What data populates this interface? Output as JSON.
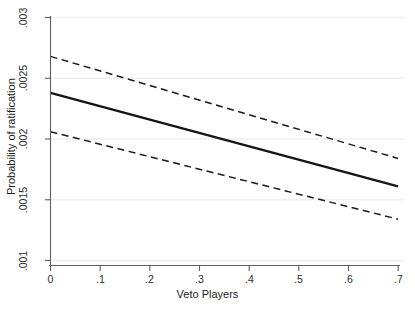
{
  "chart_data": {
    "type": "line",
    "title": "",
    "xlabel": "Veto Players",
    "ylabel": "Probability of ratification",
    "xlim": [
      0,
      0.7
    ],
    "ylim": [
      0.001,
      0.003
    ],
    "xticks": [
      "0",
      ".1",
      ".2",
      ".3",
      ".4",
      ".5",
      ".6",
      ".7"
    ],
    "xtick_values": [
      0,
      0.1,
      0.2,
      0.3,
      0.4,
      0.5,
      0.6,
      0.7
    ],
    "yticks": [
      ".001",
      ".0015",
      ".002",
      ".0025",
      ".003"
    ],
    "ytick_values": [
      0.001,
      0.0015,
      0.002,
      0.0025,
      0.003
    ],
    "grid": "horizontal",
    "legend": "none",
    "series": [
      {
        "name": "Predicted probability",
        "style": "solid",
        "color": "#1a1a1a",
        "x": [
          0,
          0.7
        ],
        "values": [
          0.00238,
          0.00161
        ]
      },
      {
        "name": "Upper 95% confidence bound",
        "style": "dashed",
        "color": "#1a1a1a",
        "x": [
          0,
          0.7
        ],
        "values": [
          0.00268,
          0.00184
        ]
      },
      {
        "name": "Lower 95% confidence bound",
        "style": "dashed",
        "color": "#1a1a1a",
        "x": [
          0,
          0.7
        ],
        "values": [
          0.00206,
          0.00134
        ]
      }
    ]
  },
  "axes": {
    "x_title": "Veto Players",
    "y_title": "Probability of ratification",
    "x_tick_labels": [
      "0",
      ".1",
      ".2",
      ".3",
      ".4",
      ".5",
      ".6",
      ".7"
    ],
    "y_tick_labels": [
      ".001",
      ".0015",
      ".002",
      ".0025",
      ".003"
    ]
  },
  "colors": {
    "line": "#1a1a1a",
    "axis": "#5a5a5a",
    "grid": "#eeeeee",
    "background": "#ffffff",
    "text": "#2b2b2b"
  }
}
